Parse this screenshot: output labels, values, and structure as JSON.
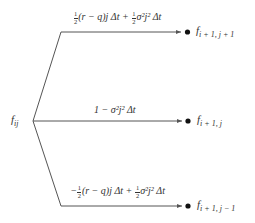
{
  "diagram": {
    "type": "trinomial-tree-branch",
    "colors": {
      "line": "#555555",
      "node": "#111111",
      "text": "#333333"
    },
    "root": {
      "label": "f",
      "subscript": "ij"
    },
    "branches": [
      {
        "id": "up",
        "probability_text": "½(r − q)j Δt + ½σ²j² Δt",
        "prob_parts": {
          "sign": "",
          "f1_num": "1",
          "f1_den": "2",
          "term1": "(r − q)j Δt + ",
          "f2_num": "1",
          "f2_den": "2",
          "term2": "σ²j² Δt"
        },
        "target": {
          "label": "f",
          "subscript": "i + 1, j + 1"
        }
      },
      {
        "id": "middle",
        "probability_text": "1 − σ²j² Δt",
        "prob_parts": {
          "term": "1 − σ²j² Δt"
        },
        "target": {
          "label": "f",
          "subscript": "i + 1, j"
        }
      },
      {
        "id": "down",
        "probability_text": "−½(r − q)j Δt + ½σ²j² Δt",
        "prob_parts": {
          "sign": "−",
          "f1_num": "1",
          "f1_den": "2",
          "term1": "(r − q)j Δt + ",
          "f2_num": "1",
          "f2_den": "2",
          "term2": "σ²j² Δt"
        },
        "target": {
          "label": "f",
          "subscript": "i + 1, j − 1"
        }
      }
    ]
  }
}
